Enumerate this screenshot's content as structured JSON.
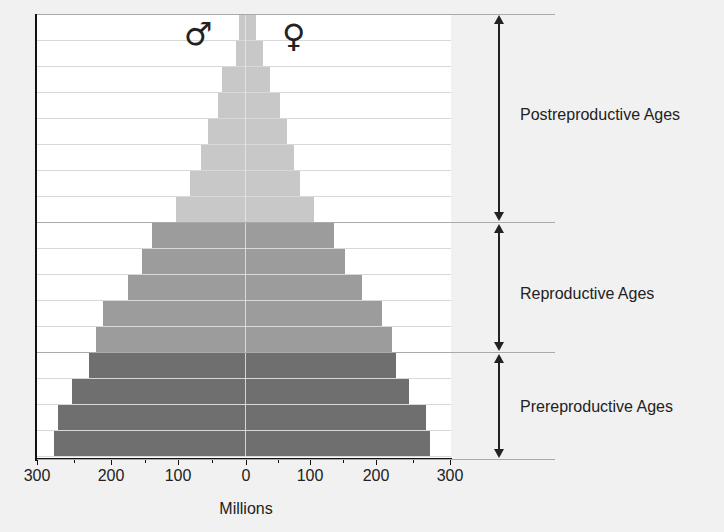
{
  "chart_data": {
    "type": "bar",
    "subtype": "population-pyramid",
    "title": "",
    "xlabel": "Millions",
    "ylabel": "",
    "xlim": [
      -300,
      300
    ],
    "x_tick_labels": [
      "300",
      "200",
      "100",
      "0",
      "100",
      "200",
      "300"
    ],
    "x_ticks": [
      -300,
      -200,
      -100,
      0,
      100,
      200,
      300
    ],
    "legend": [
      {
        "name": "Male",
        "symbol": "♂",
        "side": "left"
      },
      {
        "name": "Female",
        "symbol": "♀",
        "side": "right"
      }
    ],
    "row_order": "top-to-bottom",
    "rows": [
      {
        "group": "Postreproductive Ages",
        "male": 10,
        "female": 15
      },
      {
        "group": "Postreproductive Ages",
        "male": 15,
        "female": 25
      },
      {
        "group": "Postreproductive Ages",
        "male": 35,
        "female": 35
      },
      {
        "group": "Postreproductive Ages",
        "male": 40,
        "female": 50
      },
      {
        "group": "Postreproductive Ages",
        "male": 55,
        "female": 60
      },
      {
        "group": "Postreproductive Ages",
        "male": 65,
        "female": 70
      },
      {
        "group": "Postreproductive Ages",
        "male": 80,
        "female": 80
      },
      {
        "group": "Postreproductive Ages",
        "male": 100,
        "female": 100
      },
      {
        "group": "Reproductive Ages",
        "male": 135,
        "female": 130
      },
      {
        "group": "Reproductive Ages",
        "male": 150,
        "female": 145
      },
      {
        "group": "Reproductive Ages",
        "male": 170,
        "female": 170
      },
      {
        "group": "Reproductive Ages",
        "male": 205,
        "female": 200
      },
      {
        "group": "Reproductive Ages",
        "male": 215,
        "female": 215
      },
      {
        "group": "Prereproductive Ages",
        "male": 225,
        "female": 220
      },
      {
        "group": "Prereproductive Ages",
        "male": 250,
        "female": 240
      },
      {
        "group": "Prereproductive Ages",
        "male": 270,
        "female": 265
      },
      {
        "group": "Prereproductive Ages",
        "male": 275,
        "female": 270
      }
    ],
    "groups": [
      {
        "name": "Postreproductive Ages",
        "label": "Postreproductive Ages",
        "color": "#c8c8c8",
        "row_count": 8
      },
      {
        "name": "Reproductive Ages",
        "label": "Reproductive Ages",
        "color": "#9c9c9c",
        "row_count": 5
      },
      {
        "name": "Prereproductive Ages",
        "label": "Prereproductive Ages",
        "color": "#6f6f6f",
        "row_count": 4
      }
    ],
    "grid": true,
    "legend_position": "top-center"
  },
  "labels": {
    "male_symbol": "♂",
    "female_symbol": "♀",
    "xlabel": "Millions",
    "ticks": [
      "300",
      "200",
      "100",
      "0",
      "100",
      "200",
      "300"
    ],
    "groups": {
      "post": "Postreproductive Ages",
      "repro": "Reproductive Ages",
      "pre": "Prereproductive Ages"
    }
  }
}
